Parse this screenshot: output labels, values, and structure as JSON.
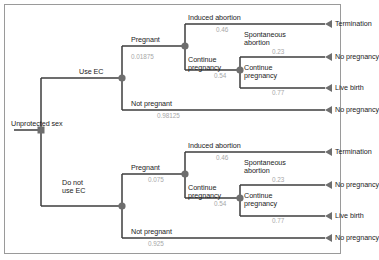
{
  "diagram": {
    "colors": {
      "stroke": "#3c3c3c",
      "node": "#6e6e6e",
      "label": "#1c1c1c",
      "probability": "#a8a8a8",
      "frame": "#9a9a9a",
      "background": "#ffffff"
    },
    "root": {
      "label": "Unprotected sex"
    },
    "branches": [
      {
        "id": "use-ec",
        "label": "Use EC",
        "children": [
          {
            "id": "pregnant",
            "label": "Pregnant",
            "probability": "0.01875"
          },
          {
            "id": "not-pregnant",
            "label": "Not pregnant",
            "probability": "0.98125"
          }
        ]
      },
      {
        "id": "no-ec",
        "label": "Do not\nuse EC",
        "label_line1": "Do not",
        "label_line2": "use EC",
        "children": [
          {
            "id": "pregnant",
            "label": "Pregnant",
            "probability": "0.075"
          },
          {
            "id": "not-pregnant",
            "label": "Not pregnant",
            "probability": "0.925"
          }
        ]
      }
    ],
    "subtree": {
      "induced_abortion": {
        "label": "Induced abortion",
        "probability": "0.46"
      },
      "continue_pregnancy_1": {
        "label_line1": "Continue",
        "label_line2": "pregnancy",
        "probability": "0.54"
      },
      "spontaneous_abortion": {
        "label_line1": "Spontaneous",
        "label_line2": "abortion",
        "probability": "0.23"
      },
      "continue_pregnancy_2": {
        "label_line1": "Continue",
        "label_line2": "pregnancy",
        "probability": "0.77"
      }
    },
    "outcomes": {
      "termination": "Termination",
      "no_pregnancy": "No pregnancy",
      "live_birth": "Live birth"
    }
  }
}
